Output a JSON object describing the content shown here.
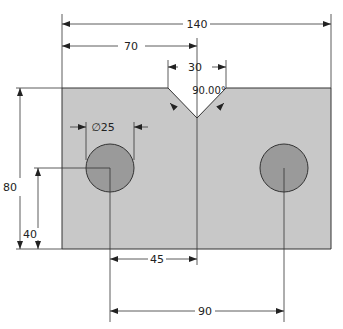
{
  "drawing": {
    "part": {
      "width_mm": 140,
      "height_mm": 80,
      "fill": "#c8c8c8",
      "outline": "#333333"
    },
    "holes": [
      {
        "diameter_mm": 25,
        "x_mm": 25,
        "y_mm": 40,
        "fill": "#9a9a9a"
      },
      {
        "diameter_mm": 25,
        "x_mm": 115,
        "y_mm": 40,
        "fill": "#9a9a9a"
      }
    ],
    "notch": {
      "top_width_mm": 30,
      "angle": "90.00°",
      "center_x_mm": 70
    }
  },
  "dimensions": {
    "overall_width": "140",
    "notch_center": "70",
    "notch_width": "30",
    "notch_angle": "90.00°",
    "hole_diameter": "∅25",
    "overall_height": "80",
    "hole_height": "40",
    "hole_to_center": "45",
    "hole_spacing": "90"
  }
}
